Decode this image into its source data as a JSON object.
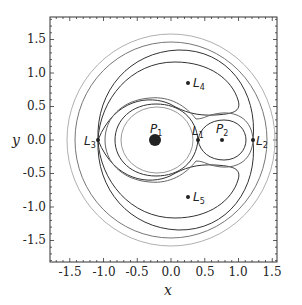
{
  "chart_data": {
    "type": "contour",
    "title": "",
    "xlabel": "x",
    "ylabel": "y",
    "xlim": [
      -1.8,
      1.8
    ],
    "ylim": [
      -1.8,
      1.8
    ],
    "xticks": [
      "-1.5",
      "-1.0",
      "-0.5",
      "0.0",
      "0.5",
      "1.0",
      "1.5"
    ],
    "yticks": [
      "1.5",
      "1.0",
      "0.5",
      "0.0",
      "-0.5",
      "-1.0",
      "-1.5"
    ],
    "grid": false,
    "mass_ratio_mu": 0.24,
    "points": [
      {
        "name": "P1",
        "label": "P",
        "sub": "1",
        "x": -0.24,
        "y": 0.0,
        "kind": "primary"
      },
      {
        "name": "P2",
        "label": "P",
        "sub": "2",
        "x": 0.76,
        "y": 0.0,
        "kind": "secondary"
      },
      {
        "name": "L1",
        "label": "L",
        "sub": "1",
        "x": 0.4,
        "y": 0.0,
        "kind": "lagrange"
      },
      {
        "name": "L2",
        "label": "L",
        "sub": "2",
        "x": 1.22,
        "y": 0.0,
        "kind": "lagrange"
      },
      {
        "name": "L3",
        "label": "L",
        "sub": "3",
        "x": -1.08,
        "y": 0.0,
        "kind": "lagrange"
      },
      {
        "name": "L4",
        "label": "L",
        "sub": "4",
        "x": 0.26,
        "y": 0.866,
        "kind": "lagrange"
      },
      {
        "name": "L5",
        "label": "L",
        "sub": "5",
        "x": 0.26,
        "y": -0.866,
        "kind": "lagrange"
      }
    ],
    "contours": [
      {
        "name": "outer-circle-1",
        "color": "#aaaaaa",
        "approx_radius": 1.55
      },
      {
        "name": "outer-circle-2",
        "color": "#777777",
        "approx_radius": 1.42
      },
      {
        "name": "L3-level",
        "color": "#333333",
        "description": "curve through L3 and L2 bounding tadpole regions"
      },
      {
        "name": "tadpole-L4",
        "color": "#333333"
      },
      {
        "name": "tadpole-L5",
        "color": "#333333"
      },
      {
        "name": "L2-level",
        "color": "#666666",
        "description": "curve through L2 enclosing both primaries"
      },
      {
        "name": "L1-level",
        "color": "#333333",
        "description": "figure-eight through L1"
      },
      {
        "name": "inner-P1",
        "color": "#888888"
      }
    ]
  },
  "axes": {
    "x_label": "x",
    "y_label": "y"
  }
}
